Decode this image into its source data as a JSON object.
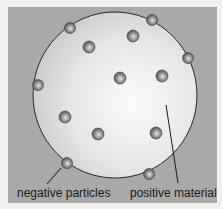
{
  "diagram": {
    "title": "",
    "labels": {
      "negative": "negative particles",
      "positive": "positive material"
    },
    "sphere": {
      "cx": 115,
      "cy": 95,
      "rx": 82,
      "ry": 83
    },
    "particles": [
      {
        "x": 70,
        "y": 28,
        "on_edge": true
      },
      {
        "x": 152,
        "y": 20,
        "on_edge": true
      },
      {
        "x": 89,
        "y": 47,
        "on_edge": false
      },
      {
        "x": 133,
        "y": 36,
        "on_edge": false
      },
      {
        "x": 188,
        "y": 58,
        "on_edge": true
      },
      {
        "x": 120,
        "y": 78,
        "on_edge": false
      },
      {
        "x": 162,
        "y": 76,
        "on_edge": false
      },
      {
        "x": 38,
        "y": 85,
        "on_edge": true
      },
      {
        "x": 65,
        "y": 117,
        "on_edge": false
      },
      {
        "x": 98,
        "y": 134,
        "on_edge": false
      },
      {
        "x": 156,
        "y": 133,
        "on_edge": false
      },
      {
        "x": 67,
        "y": 163,
        "on_edge": true
      },
      {
        "x": 149,
        "y": 174,
        "on_edge": true
      }
    ],
    "colors": {
      "background": "#a9a9a7",
      "sphere": "#e2e2e0",
      "particle": "#8a8c8a",
      "outline": "#2a2a2a"
    }
  }
}
